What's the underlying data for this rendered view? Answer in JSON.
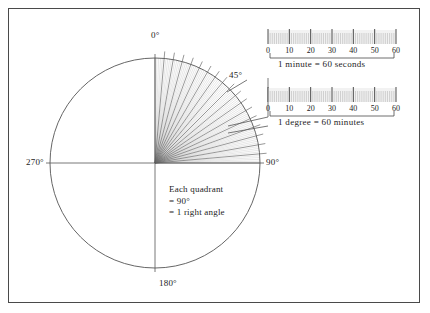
{
  "figure": {
    "frame_color": "#4a4a4a",
    "background": "#ffffff",
    "ink_color": "#1c1c1c"
  },
  "circle": {
    "center_x": 155,
    "center_y": 163,
    "radius": 105,
    "stroke": "#555555",
    "quadrant_note": {
      "line1": "Each quadrant",
      "line2": "= 90°",
      "line3": "= 1 right angle"
    },
    "labels": [
      {
        "name": "zero-degrees",
        "text": "0°",
        "angle_deg": 0,
        "x": 151,
        "y": 33
      },
      {
        "name": "ninety-degrees",
        "text": "90°",
        "angle_deg": 90,
        "x": 266,
        "y": 158
      },
      {
        "name": "one-eighty-degrees",
        "text": "180°",
        "angle_deg": 180,
        "x": 159,
        "y": 281
      },
      {
        "name": "two-seventy-degrees",
        "text": "270°",
        "angle_deg": 270,
        "x": 27,
        "y": 158
      },
      {
        "name": "forty-five-degrees",
        "text": "45°",
        "angle_deg": 45,
        "x": 229,
        "y": 74
      }
    ],
    "fan": {
      "minor_step_deg": 1,
      "major_step_deg": 5,
      "start_deg": 0,
      "end_deg": 90,
      "minor_color": "#b9b9b9",
      "major_color": "#6a6a6a"
    }
  },
  "rulers": [
    {
      "id": "minute-ruler",
      "caption": "1  minute  =  60  seconds",
      "ticks_total": 60,
      "major_every": 10,
      "tick_labels": [
        "0",
        "10",
        "20",
        "30",
        "40",
        "50",
        "60"
      ],
      "x": 268,
      "y": 30,
      "width": 128,
      "height": 14
    },
    {
      "id": "degree-ruler",
      "caption": "1  degree  =  60  minutes",
      "ticks_total": 60,
      "major_every": 10,
      "tick_labels": [
        "0",
        "10",
        "20",
        "30",
        "40",
        "50",
        "60"
      ],
      "x": 268,
      "y": 88,
      "width": 128,
      "height": 14
    }
  ]
}
